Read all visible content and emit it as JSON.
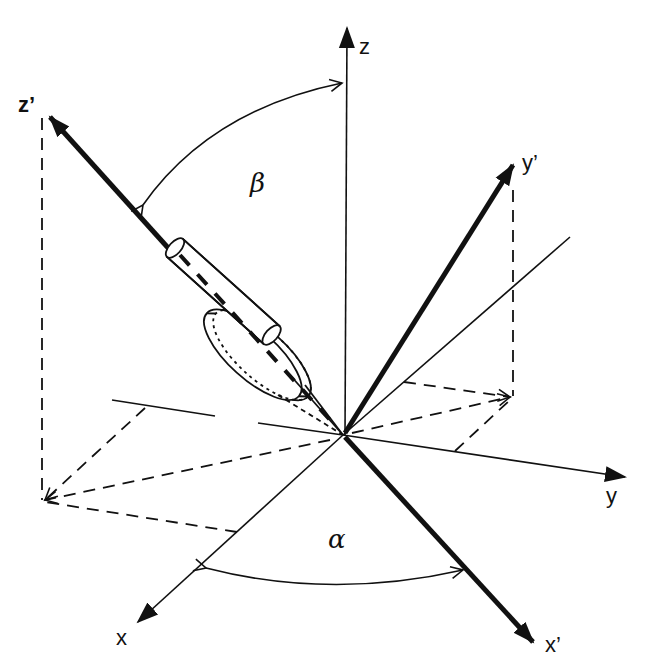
{
  "diagram": {
    "type": "euler-angle-rotation",
    "colors": {
      "ink": "#111111",
      "background": "#ffffff"
    },
    "origin": {
      "x": 343,
      "y": 435
    },
    "axes": {
      "z": {
        "label": "z",
        "style": "thin",
        "tip": {
          "x": 347,
          "y": 25
        }
      },
      "y": {
        "label": "y",
        "style": "thin",
        "tip": {
          "x": 625,
          "y": 477
        }
      },
      "x": {
        "label": "x",
        "style": "thin",
        "tip": {
          "x": 138,
          "y": 622
        }
      },
      "z_prime": {
        "label": "z’",
        "style": "thick",
        "tip": {
          "x": 45,
          "y": 112
        }
      },
      "y_prime": {
        "label": "y’",
        "style": "thick",
        "tip": {
          "x": 515,
          "y": 162
        }
      },
      "x_prime": {
        "label": "x’",
        "style": "thick",
        "tip": {
          "x": 535,
          "y": 645
        }
      }
    },
    "angles": {
      "beta": {
        "label": "β",
        "between": [
          "z",
          "z’"
        ]
      },
      "alpha": {
        "label": "α",
        "between": [
          "x",
          "x’"
        ]
      }
    },
    "object": {
      "name": "cylinder-with-disc",
      "aligned_with": "z’"
    }
  }
}
